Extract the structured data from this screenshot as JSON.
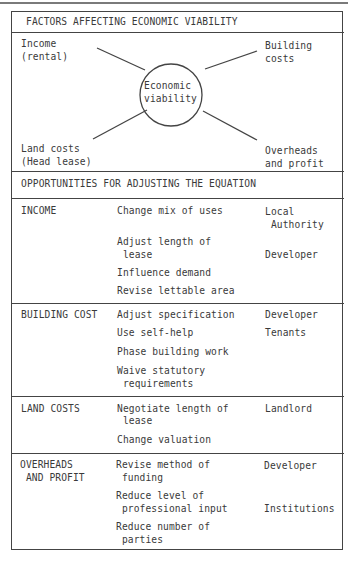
{
  "top_header": {
    "title": "FACTORS AFFECTING ECONOMIC VIABILITY"
  },
  "diagram": {
    "center": {
      "line1": "Economic",
      "line2": "viability"
    },
    "income": {
      "line1": "Income",
      "line2": "(rental)"
    },
    "building": {
      "line1": "Building",
      "line2": "costs"
    },
    "land": {
      "line1": "Land costs",
      "line2": "(Head lease)"
    },
    "overheads": {
      "line1": "Overheads",
      "line2": "and profit"
    }
  },
  "opportunities": {
    "title": "OPPORTUNITIES FOR ADJUSTING THE EQUATION",
    "sections": [
      {
        "factor": [
          "INCOME"
        ],
        "actions": [
          {
            "text": [
              "Change mix of uses"
            ],
            "party": [
              "Local",
              " Authority"
            ]
          },
          {
            "text": [
              "Adjust length of",
              " lease"
            ],
            "party": [
              "",
              "Developer"
            ]
          },
          {
            "text": [
              "Influence demand"
            ],
            "party": []
          },
          {
            "text": [
              "Revise lettable area"
            ],
            "party": []
          }
        ]
      },
      {
        "factor": [
          "BUILDING COST"
        ],
        "actions": [
          {
            "text": [
              "Adjust specification"
            ],
            "party": [
              "Developer"
            ]
          },
          {
            "text": [
              "Use self-help"
            ],
            "party": [
              "Tenants"
            ]
          },
          {
            "text": [
              "Phase building work"
            ],
            "party": []
          },
          {
            "text": [
              "Waive statutory",
              " requirements"
            ],
            "party": []
          }
        ]
      },
      {
        "factor": [
          "LAND COSTS"
        ],
        "actions": [
          {
            "text": [
              "Negotiate length of",
              " lease"
            ],
            "party": [
              "Landlord"
            ]
          },
          {
            "text": [
              "Change valuation"
            ],
            "party": []
          }
        ]
      },
      {
        "factor": [
          "OVERHEADS",
          " AND PROFIT"
        ],
        "actions": [
          {
            "text": [
              "Revise method of",
              " funding"
            ],
            "party": [
              "Developer"
            ]
          },
          {
            "text": [
              "Reduce level of",
              " professional input"
            ],
            "party": [
              "",
              "Institutions"
            ]
          },
          {
            "text": [
              "Reduce number of",
              " parties"
            ],
            "party": []
          }
        ]
      }
    ]
  }
}
